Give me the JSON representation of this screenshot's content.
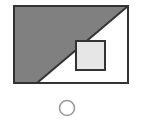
{
  "figure": {
    "canvas": {
      "width": 143,
      "height": 122,
      "background_color": "#ffffff"
    },
    "colors": {
      "outline": "#333333",
      "shaded_triangle_fill": "#808080",
      "unshaded_fill": "#ffffff",
      "inner_square_fill": "#e6e6e6",
      "circle_stroke": "#999999"
    },
    "shapes": {
      "outer_rectangle": {
        "name": "outer-rectangle",
        "x": 14,
        "y": 6,
        "width": 114,
        "height": 77,
        "stroke_width": 2,
        "fill": "#ffffff",
        "stroke": "#333333"
      },
      "shaded_triangle": {
        "name": "shaded-triangle",
        "points": "14,6 128,6 37,83 14,83",
        "fill": "#808080",
        "description": "shaded region bounded by diagonal from top-right corner to bottom edge"
      },
      "diagonal_line": {
        "name": "diagonal-line",
        "x1": 128,
        "y1": 6,
        "x2": 37,
        "y2": 83,
        "stroke": "#333333",
        "stroke_width": 2
      },
      "inner_square": {
        "name": "inner-square",
        "x": 76,
        "y": 41,
        "width": 29,
        "height": 29,
        "fill": "#e6e6e6",
        "stroke": "#333333",
        "stroke_width": 2
      },
      "circle_marker": {
        "name": "circle-marker",
        "cx": 67,
        "cy": 108,
        "r": 7.5,
        "fill": "none",
        "stroke": "#999999",
        "stroke_width": 1.6
      }
    }
  }
}
